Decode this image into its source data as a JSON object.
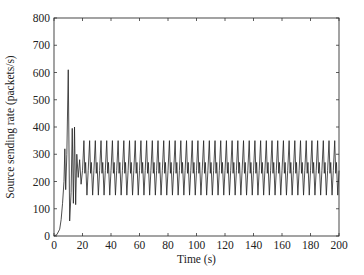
{
  "chart_data": {
    "type": "line",
    "title": "",
    "xlabel": "Time (s)",
    "ylabel": "Source sending rate (packets/s)",
    "xlim": [
      0,
      200
    ],
    "ylim": [
      0,
      800
    ],
    "xticks": [
      0,
      20,
      40,
      60,
      80,
      100,
      120,
      140,
      160,
      180,
      200
    ],
    "yticks": [
      0,
      100,
      200,
      300,
      400,
      500,
      600,
      700,
      800
    ],
    "grid": false,
    "legend": null,
    "series": [
      {
        "name": "Source sending rate",
        "color": "#222222",
        "transient": [
          [
            0,
            0
          ],
          [
            2,
            5
          ],
          [
            4,
            25
          ],
          [
            5,
            60
          ],
          [
            6,
            120
          ],
          [
            7,
            200
          ],
          [
            7.6,
            320
          ],
          [
            8.2,
            170
          ],
          [
            9,
            300
          ],
          [
            10,
            610
          ],
          [
            11,
            55
          ],
          [
            12,
            160
          ],
          [
            12.8,
            395
          ],
          [
            13.6,
            120
          ],
          [
            14.4,
            400
          ],
          [
            15.2,
            115
          ],
          [
            16,
            300
          ],
          [
            17,
            215
          ],
          [
            18,
            280
          ],
          [
            19,
            190
          ]
        ],
        "steady_state": {
          "start": 20,
          "end": 200,
          "period_s": 4,
          "peak": 350,
          "trough": 150,
          "mean": 250,
          "secondary_peak": 270,
          "secondary_trough": 230
        }
      }
    ]
  }
}
